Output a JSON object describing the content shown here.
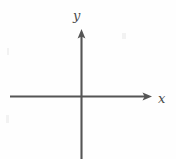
{
  "figure": {
    "background_color": "#fefefe",
    "line_color": "#555555",
    "label_color": "#4a4a4a"
  },
  "labels": {
    "y_axis": "y",
    "x_axis": "x"
  },
  "chart_data": {
    "type": "line",
    "title": "",
    "subtitle": "",
    "xlabel": "x",
    "ylabel": "y",
    "series": [],
    "categories": [],
    "values": [],
    "xlim": [
      -1,
      1
    ],
    "ylim": [
      -1,
      1
    ],
    "grid": false,
    "legend": "none",
    "annotations": [
      {
        "text": "y",
        "role": "y-axis-label",
        "position": "top of vertical axis"
      },
      {
        "text": "x",
        "role": "x-axis-label",
        "position": "right of horizontal axis"
      }
    ],
    "axes": {
      "x_axis": {
        "orientation": "horizontal",
        "arrow": "right",
        "start_px": [
          10,
          97
        ],
        "end_px": [
          152,
          97
        ],
        "tick_labels": []
      },
      "y_axis": {
        "orientation": "vertical",
        "arrow": "up",
        "start_px": [
          81,
          159
        ],
        "end_px": [
          81,
          29
        ],
        "tick_labels": []
      },
      "origin_px": [
        81,
        97
      ]
    }
  }
}
